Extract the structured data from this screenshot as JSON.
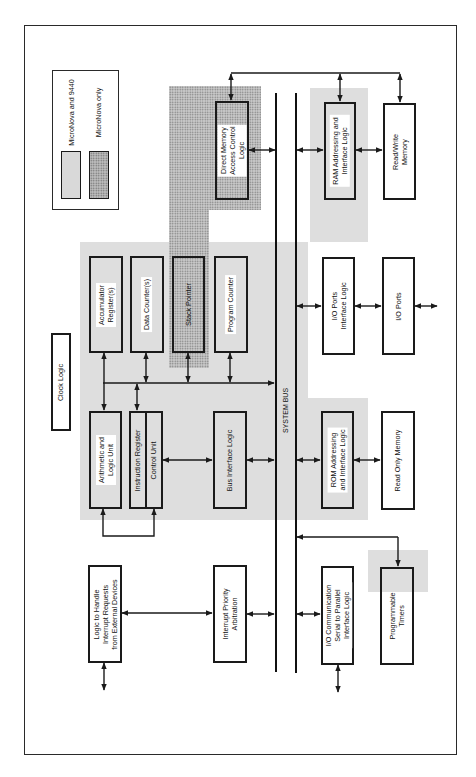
{
  "diagram": {
    "type": "block-diagram",
    "orientation": "rotated-90-ccw",
    "legend": {
      "items": [
        {
          "label": "MicroNova and 9440",
          "pattern": "light-gray"
        },
        {
          "label": "MicroNova only",
          "pattern": "dotted"
        }
      ]
    },
    "bus_label": "SYSTEM BUS",
    "blocks": {
      "dma": "Direct Memory\nAccess Control\nLogic",
      "ram_logic": "RAM Addressing and\nInterface Logic",
      "rw_memory": "Read/Write\nMemory",
      "accumulator": "Accumulator\nRegister(s)",
      "data_counter": "Data Counter(s)",
      "stack_pointer": "Stack Pointer",
      "program_counter": "Program Counter",
      "io_ports_logic": "I/O Ports\nInterface Logic",
      "io_ports": "I/O Ports",
      "clock_logic": "Clock Logic",
      "alu": "Arithmetic and\nLogic Unit",
      "instruction_register": "Instruction Register",
      "control_unit": "Control Unit",
      "bus_interface": "Bus Interface Logic",
      "rom_logic": "ROM Addressing\nand Interface Logic",
      "rom": "Read Only Memory",
      "interrupt_logic": "Logic to Handle\nInterrupt Requests\nfrom External Devices",
      "interrupt_priority": "Interrupt Priority\nArbitration",
      "io_comm": "I/O Communication\nSerial to Parallel\nInterface Logic",
      "timers": "Programmable\nTimers"
    },
    "colors": {
      "line": "#1a1a1a",
      "shade_gray": "#dedede",
      "shade_dots": "#c9c9c9"
    }
  }
}
